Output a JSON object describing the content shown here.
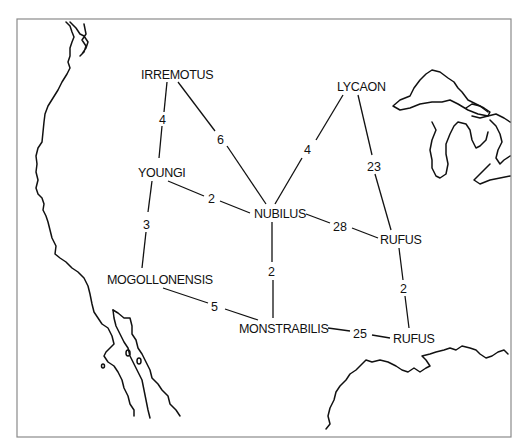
{
  "map": {
    "frame_color": "#8a8a8a",
    "ink_color": "#111111",
    "nodes": [
      {
        "id": "irremotus",
        "label": "IRREMOTUS",
        "x": 141,
        "y": 79
      },
      {
        "id": "lycaon",
        "label": "LYCAON",
        "x": 337,
        "y": 91
      },
      {
        "id": "youngi",
        "label": "YOUNGI",
        "x": 138,
        "y": 177
      },
      {
        "id": "nubilus",
        "label": "NUBILUS",
        "x": 254,
        "y": 218
      },
      {
        "id": "rufus_north",
        "label": "RUFUS",
        "x": 380,
        "y": 244
      },
      {
        "id": "mogollonensis",
        "label": "MOGOLLONENSIS",
        "x": 107,
        "y": 284
      },
      {
        "id": "monstrabilis",
        "label": "MONSTRABILIS",
        "x": 239,
        "y": 333
      },
      {
        "id": "rufus_south",
        "label": "RUFUS",
        "x": 393,
        "y": 343
      }
    ],
    "edges": [
      {
        "from": "irremotus",
        "to": "youngi",
        "label": "4",
        "lx": 146,
        "ly": 121
      },
      {
        "from": "irremotus",
        "to": "nubilus",
        "label": "6",
        "lx": 218,
        "ly": 144
      },
      {
        "from": "lycaon",
        "to": "nubilus",
        "label": "4",
        "lx": 304,
        "ly": 154
      },
      {
        "from": "lycaon",
        "to": "rufus_north",
        "label": "23",
        "lx": 368,
        "ly": 170
      },
      {
        "from": "youngi",
        "to": "nubilus",
        "label": "2",
        "lx": 208,
        "ly": 203
      },
      {
        "from": "youngi",
        "to": "mogollonensis",
        "label": "3",
        "lx": 143,
        "ly": 228
      },
      {
        "from": "nubilus",
        "to": "rufus_north",
        "label": "28",
        "lx": 333,
        "ly": 231
      },
      {
        "from": "nubilus",
        "to": "monstrabilis",
        "label": "2",
        "lx": 268,
        "ly": 276
      },
      {
        "from": "rufus_north",
        "to": "rufus_south",
        "label": "2",
        "lx": 400,
        "ly": 293
      },
      {
        "from": "mogollonensis",
        "to": "monstrabilis",
        "label": "5",
        "lx": 211,
        "ly": 311
      },
      {
        "from": "monstrabilis",
        "to": "rufus_south",
        "label": "25",
        "lx": 353,
        "ly": 334
      }
    ]
  }
}
